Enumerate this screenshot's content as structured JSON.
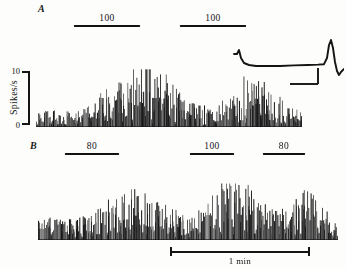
{
  "figure": {
    "background": "#fdfdfc",
    "ink_color": "#141414"
  },
  "panels": [
    {
      "id": "A",
      "label": "A",
      "label_x": 38,
      "label_y": 3,
      "plot": {
        "x": 36,
        "y": 57,
        "width": 266,
        "height": 70
      },
      "baseline_y": 127,
      "yaxis": {
        "label": "Spikes/s",
        "ticks": [
          {
            "value": 0,
            "label": "0",
            "y": 125
          },
          {
            "value": 10,
            "label": "10",
            "y": 71
          }
        ],
        "bracket": {
          "x": 22,
          "y": 71,
          "height": 54
        },
        "label_x": 4,
        "label_y": 99
      },
      "stimuli": [
        {
          "label": "100",
          "x": 74,
          "y": 13,
          "width": 66
        },
        {
          "label": "100",
          "x": 180,
          "y": 13,
          "width": 66
        }
      ]
    },
    {
      "id": "B",
      "label": "B",
      "label_x": 30,
      "label_y": 140,
      "plot": {
        "x": 38,
        "y": 168,
        "width": 300,
        "height": 72
      },
      "baseline_y": 240,
      "yaxis": null,
      "stimuli": [
        {
          "label": "80",
          "x": 65,
          "y": 141,
          "width": 54
        },
        {
          "label": "100",
          "x": 190,
          "y": 141,
          "width": 44
        },
        {
          "label": "80",
          "x": 263,
          "y": 141,
          "width": 42
        }
      ]
    }
  ],
  "chart_data": {
    "type": "line",
    "xlabel": "Time",
    "ylabel": "Spikes/s",
    "ylim": [
      0,
      13
    ],
    "grid": false,
    "legend": "none",
    "time_scale": {
      "label": "1 min",
      "x": 170,
      "y": 247,
      "width": 140
    },
    "series": [
      {
        "name": "A",
        "panel": "A",
        "n_bins": 236,
        "seed": 20431,
        "noise": 0.82,
        "baseline": 2.1,
        "envelope": [
          {
            "t": 0.0,
            "v": 2.0
          },
          {
            "t": 0.04,
            "v": 2.3
          },
          {
            "t": 0.09,
            "v": 2.2
          },
          {
            "t": 0.14,
            "v": 2.6
          },
          {
            "t": 0.18,
            "v": 3.1
          },
          {
            "t": 0.22,
            "v": 3.9
          },
          {
            "t": 0.26,
            "v": 5.0
          },
          {
            "t": 0.3,
            "v": 6.4
          },
          {
            "t": 0.34,
            "v": 8.0
          },
          {
            "t": 0.37,
            "v": 9.2
          },
          {
            "t": 0.4,
            "v": 9.9
          },
          {
            "t": 0.43,
            "v": 9.4
          },
          {
            "t": 0.46,
            "v": 8.3
          },
          {
            "t": 0.5,
            "v": 7.0
          },
          {
            "t": 0.54,
            "v": 5.5
          },
          {
            "t": 0.58,
            "v": 4.2
          },
          {
            "t": 0.62,
            "v": 3.2
          },
          {
            "t": 0.66,
            "v": 2.6
          },
          {
            "t": 0.7,
            "v": 3.4
          },
          {
            "t": 0.74,
            "v": 5.0
          },
          {
            "t": 0.78,
            "v": 6.6
          },
          {
            "t": 0.81,
            "v": 7.6
          },
          {
            "t": 0.84,
            "v": 7.1
          },
          {
            "t": 0.87,
            "v": 6.2
          },
          {
            "t": 0.9,
            "v": 5.0
          },
          {
            "t": 0.94,
            "v": 3.6
          },
          {
            "t": 0.97,
            "v": 2.8
          },
          {
            "t": 1.0,
            "v": 2.4
          }
        ],
        "peak_value": 10.5,
        "peak_time_fraction": 0.4
      },
      {
        "name": "B",
        "panel": "B",
        "n_bins": 262,
        "seed": 77219,
        "noise": 0.86,
        "baseline": 2.4,
        "envelope": [
          {
            "t": 0.0,
            "v": 2.6
          },
          {
            "t": 0.03,
            "v": 3.4
          },
          {
            "t": 0.07,
            "v": 3.0
          },
          {
            "t": 0.11,
            "v": 3.3
          },
          {
            "t": 0.15,
            "v": 3.6
          },
          {
            "t": 0.19,
            "v": 4.3
          },
          {
            "t": 0.23,
            "v": 5.4
          },
          {
            "t": 0.27,
            "v": 6.6
          },
          {
            "t": 0.31,
            "v": 7.4
          },
          {
            "t": 0.34,
            "v": 7.0
          },
          {
            "t": 0.38,
            "v": 6.1
          },
          {
            "t": 0.42,
            "v": 5.0
          },
          {
            "t": 0.46,
            "v": 4.0
          },
          {
            "t": 0.5,
            "v": 3.2
          },
          {
            "t": 0.53,
            "v": 3.6
          },
          {
            "t": 0.56,
            "v": 4.6
          },
          {
            "t": 0.59,
            "v": 6.2
          },
          {
            "t": 0.62,
            "v": 8.0
          },
          {
            "t": 0.645,
            "v": 9.0
          },
          {
            "t": 0.67,
            "v": 8.4
          },
          {
            "t": 0.7,
            "v": 7.2
          },
          {
            "t": 0.74,
            "v": 5.8
          },
          {
            "t": 0.78,
            "v": 4.6
          },
          {
            "t": 0.81,
            "v": 4.0
          },
          {
            "t": 0.84,
            "v": 5.0
          },
          {
            "t": 0.87,
            "v": 6.4
          },
          {
            "t": 0.9,
            "v": 7.3
          },
          {
            "t": 0.925,
            "v": 6.8
          },
          {
            "t": 0.95,
            "v": 5.4
          },
          {
            "t": 0.97,
            "v": 3.6
          },
          {
            "t": 1.0,
            "v": 2.6
          }
        ],
        "peak_value": 10.0,
        "peak_time_fraction": 0.645
      }
    ]
  },
  "inset": {
    "name": "action-potential-waveform",
    "x": 232,
    "y": 38,
    "width": 112,
    "height": 48,
    "waveform_points": "2,16 5,16 7,12 9,20 12,25 17,27 24,28 34,28 48,28 62,27.4 76,27 86,26.6 92,26.2 95,20 97,7 99,2 101,10 103,24 105,33 107,37 109,34 112,31",
    "calibration": {
      "vertical_x": 86,
      "vertical_y0": 30,
      "vertical_y1": 46,
      "horizontal_y": 46,
      "horizontal_x0": 58,
      "horizontal_x1": 86
    }
  }
}
